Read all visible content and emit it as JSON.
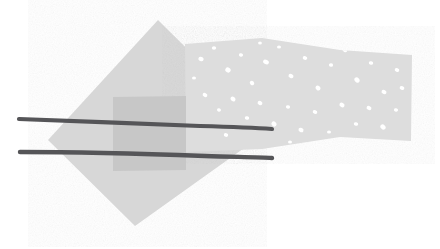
{
  "canvas": {
    "width": 440,
    "height": 249,
    "background_color": "#ffffff",
    "title": "Abstract overlapping shapes with two dark strokes"
  },
  "palette": {
    "diamond_fill": "#d7d7d7",
    "band_fill": "#dddddd",
    "overlap_fill": "#c7c7c7",
    "speckle_fill": "#ffffff",
    "stroke_color": "#555558",
    "background": "#ffffff"
  },
  "shapes": {
    "diamond": {
      "name": "gray-diamond",
      "fill": "#d7d7d7",
      "opacity": 1,
      "points": "158,20 247,108 247,146 135,226 48,140"
    },
    "band": {
      "name": "speckled-band",
      "fill": "#dddddd",
      "opacity": 1,
      "points": "185,44 262,38 340,50 412,55 411,141 340,137 262,149 186,152"
    },
    "overlap_rect": {
      "name": "overlap-rectangle",
      "fill": "#c7c7c7",
      "opacity": 1,
      "points": "113,97 186,96 186,170 113,171"
    }
  },
  "strokes": [
    {
      "name": "upper-stroke",
      "path": "M 19,119 C 70,121 150,124 200,126 C 235,127 258,128 272,129",
      "width": 4.2,
      "color": "#555558"
    },
    {
      "name": "lower-stroke",
      "path": "M 20,152 C 70,152 150,154 205,156 C 238,157 260,157 272,158",
      "width": 4.4,
      "color": "#555558"
    }
  ],
  "speckles": [
    {
      "cx": 201,
      "cy": 59,
      "rx": 2.6,
      "ry": 2.2,
      "rot": 20
    },
    {
      "cx": 214,
      "cy": 48,
      "rx": 2.2,
      "ry": 1.8,
      "rot": 0
    },
    {
      "cx": 228,
      "cy": 70,
      "rx": 2.8,
      "ry": 2.4,
      "rot": 35
    },
    {
      "cx": 241,
      "cy": 55,
      "rx": 2.1,
      "ry": 1.7,
      "rot": 10
    },
    {
      "cx": 252,
      "cy": 83,
      "rx": 2.4,
      "ry": 2.0,
      "rot": 45
    },
    {
      "cx": 266,
      "cy": 62,
      "rx": 3.0,
      "ry": 2.2,
      "rot": 25
    },
    {
      "cx": 279,
      "cy": 47,
      "rx": 2.0,
      "ry": 1.6,
      "rot": 0
    },
    {
      "cx": 291,
      "cy": 76,
      "rx": 2.6,
      "ry": 2.1,
      "rot": 30
    },
    {
      "cx": 305,
      "cy": 58,
      "rx": 2.3,
      "ry": 1.9,
      "rot": 15
    },
    {
      "cx": 318,
      "cy": 88,
      "rx": 2.7,
      "ry": 2.2,
      "rot": 40
    },
    {
      "cx": 331,
      "cy": 65,
      "rx": 2.1,
      "ry": 1.8,
      "rot": 5
    },
    {
      "cx": 345,
      "cy": 50,
      "rx": 2.5,
      "ry": 2.0,
      "rot": 20
    },
    {
      "cx": 357,
      "cy": 80,
      "rx": 2.9,
      "ry": 2.3,
      "rot": 50
    },
    {
      "cx": 371,
      "cy": 63,
      "rx": 2.2,
      "ry": 1.8,
      "rot": 12
    },
    {
      "cx": 384,
      "cy": 92,
      "rx": 2.6,
      "ry": 2.1,
      "rot": 28
    },
    {
      "cx": 397,
      "cy": 70,
      "rx": 2.3,
      "ry": 1.9,
      "rot": 18
    },
    {
      "cx": 205,
      "cy": 95,
      "rx": 2.4,
      "ry": 2.0,
      "rot": 22
    },
    {
      "cx": 219,
      "cy": 110,
      "rx": 2.0,
      "ry": 1.7,
      "rot": 8
    },
    {
      "cx": 233,
      "cy": 99,
      "rx": 2.7,
      "ry": 2.2,
      "rot": 38
    },
    {
      "cx": 247,
      "cy": 118,
      "rx": 2.2,
      "ry": 1.8,
      "rot": 14
    },
    {
      "cx": 260,
      "cy": 103,
      "rx": 2.5,
      "ry": 2.1,
      "rot": 30
    },
    {
      "cx": 274,
      "cy": 124,
      "rx": 2.8,
      "ry": 2.3,
      "rot": 42
    },
    {
      "cx": 288,
      "cy": 107,
      "rx": 2.1,
      "ry": 1.7,
      "rot": 6
    },
    {
      "cx": 301,
      "cy": 130,
      "rx": 2.6,
      "ry": 2.1,
      "rot": 26
    },
    {
      "cx": 315,
      "cy": 112,
      "rx": 2.3,
      "ry": 1.9,
      "rot": 16
    },
    {
      "cx": 329,
      "cy": 132,
      "rx": 2.0,
      "ry": 1.6,
      "rot": 0
    },
    {
      "cx": 342,
      "cy": 105,
      "rx": 2.7,
      "ry": 2.2,
      "rot": 34
    },
    {
      "cx": 356,
      "cy": 124,
      "rx": 2.2,
      "ry": 1.8,
      "rot": 11
    },
    {
      "cx": 369,
      "cy": 108,
      "rx": 2.5,
      "ry": 2.0,
      "rot": 24
    },
    {
      "cx": 383,
      "cy": 127,
      "rx": 2.9,
      "ry": 2.3,
      "rot": 46
    },
    {
      "cx": 396,
      "cy": 110,
      "rx": 2.1,
      "ry": 1.7,
      "rot": 9
    },
    {
      "cx": 194,
      "cy": 78,
      "rx": 2.0,
      "ry": 1.6,
      "rot": 0
    },
    {
      "cx": 260,
      "cy": 43,
      "rx": 1.9,
      "ry": 1.5,
      "rot": 0
    },
    {
      "cx": 402,
      "cy": 88,
      "rx": 2.4,
      "ry": 1.9,
      "rot": 20
    },
    {
      "cx": 226,
      "cy": 135,
      "rx": 2.2,
      "ry": 1.8,
      "rot": 15
    },
    {
      "cx": 290,
      "cy": 142,
      "rx": 2.0,
      "ry": 1.6,
      "rot": 0
    }
  ]
}
